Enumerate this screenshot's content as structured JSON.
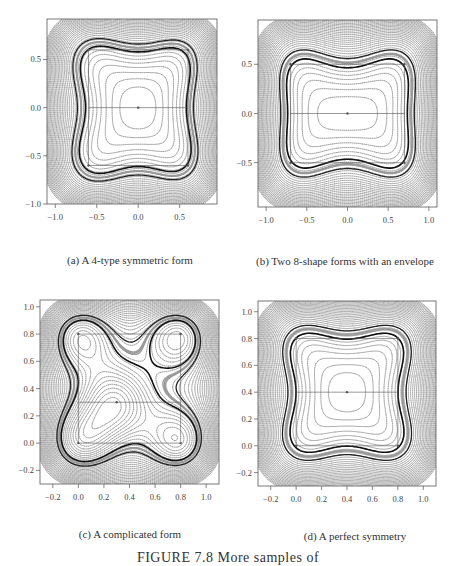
{
  "chart_data": [
    {
      "id": "a",
      "type": "contour",
      "title": "(a) A 4-type symmetric form",
      "xlim": [
        -1.1,
        0.95
      ],
      "ylim": [
        -1.0,
        0.92
      ],
      "xticks": [
        -1.0,
        -0.5,
        0.0,
        0.5
      ],
      "yticks": [
        -1.0,
        -0.5,
        0.0,
        0.5
      ],
      "xtick_labels": [
        "−1.0",
        "−0.5",
        "0.0",
        "0.5"
      ],
      "ytick_labels": [
        "−1.0",
        "−0.5",
        "0.0",
        "0.5"
      ],
      "centers": [
        [
          -0.6,
          0.6
        ],
        [
          0.6,
          0.6
        ],
        [
          0.0,
          0.0
        ],
        [
          -0.6,
          -0.6
        ],
        [
          0.6,
          -0.6
        ]
      ],
      "saddles": [
        [
          0.0,
          0.6
        ],
        [
          -0.6,
          0.0
        ],
        [
          0.6,
          0.0
        ],
        [
          0.0,
          -0.6
        ]
      ],
      "grid": "lines connecting centers"
    },
    {
      "id": "b",
      "type": "contour",
      "title": "(b) Two 8-shape forms with an envelope",
      "xlim": [
        -1.1,
        1.1
      ],
      "ylim": [
        -0.95,
        0.95
      ],
      "xticks": [
        -1.0,
        -0.5,
        0.0,
        0.5,
        1.0
      ],
      "yticks": [
        -0.5,
        0.0,
        0.5
      ],
      "xtick_labels": [
        "−1.0",
        "−0.5",
        "0.0",
        "0.5",
        "1.0"
      ],
      "ytick_labels": [
        "−0.5",
        "0.0",
        "0.5"
      ],
      "centers": [
        [
          -0.7,
          0.5
        ],
        [
          -0.7,
          -0.5
        ],
        [
          0.7,
          0.5
        ],
        [
          0.7,
          -0.5
        ],
        [
          0.0,
          0.0
        ]
      ],
      "saddles": [
        [
          -0.7,
          0.0
        ],
        [
          0.7,
          0.0
        ],
        [
          0.0,
          0.5
        ],
        [
          0.0,
          -0.5
        ]
      ]
    },
    {
      "id": "c",
      "type": "contour",
      "title": "(c) A complicated form",
      "xlim": [
        -0.3,
        1.1
      ],
      "ylim": [
        -0.3,
        1.05
      ],
      "xticks": [
        -0.2,
        0.0,
        0.2,
        0.4,
        0.6,
        0.8,
        1.0
      ],
      "yticks": [
        -0.2,
        0.0,
        0.2,
        0.4,
        0.6,
        0.8,
        1.0
      ],
      "xtick_labels": [
        "−0.2",
        "0.0",
        "0.2",
        "0.4",
        "0.6",
        "0.8",
        "1.0"
      ],
      "ytick_labels": [
        "−0.2",
        "0.0",
        "0.2",
        "0.4",
        "0.6",
        "0.8",
        "1.0"
      ],
      "centers": [
        [
          0.0,
          0.8
        ],
        [
          0.8,
          0.8
        ],
        [
          0.3,
          0.3
        ],
        [
          0.0,
          0.0
        ],
        [
          0.8,
          0.0
        ]
      ],
      "saddles": [
        [
          0.3,
          0.8
        ],
        [
          0.0,
          0.3
        ],
        [
          0.8,
          0.3
        ],
        [
          0.3,
          0.0
        ]
      ]
    },
    {
      "id": "d",
      "type": "contour",
      "title": "(d) A perfect symmetry",
      "xlim": [
        -0.3,
        1.1
      ],
      "ylim": [
        -0.3,
        1.08
      ],
      "xticks": [
        -0.2,
        0.0,
        0.2,
        0.4,
        0.6,
        0.8,
        1.0
      ],
      "yticks": [
        -0.2,
        0.0,
        0.2,
        0.4,
        0.6,
        0.8,
        1.0
      ],
      "xtick_labels": [
        "−0.2",
        "0.0",
        "0.2",
        "0.4",
        "0.6",
        "0.8",
        "1.0"
      ],
      "ytick_labels": [
        "−0.2",
        "0.0",
        "0.2",
        "0.4",
        "0.6",
        "0.8",
        "1.0"
      ],
      "centers": [
        [
          0.0,
          0.8
        ],
        [
          0.8,
          0.8
        ],
        [
          0.4,
          0.4
        ],
        [
          0.0,
          0.0
        ],
        [
          0.8,
          0.0
        ]
      ],
      "saddles": [
        [
          0.4,
          0.8
        ],
        [
          0.0,
          0.4
        ],
        [
          0.8,
          0.4
        ],
        [
          0.4,
          0.0
        ]
      ]
    }
  ],
  "captions": {
    "a": "(a) A 4-type symmetric form",
    "b": "(b) Two 8-shape forms with an envelope",
    "c": "(c) A complicated form",
    "d": "(d) A perfect symmetry"
  },
  "figure_caption": "FIGURE 7.8   More samples of"
}
